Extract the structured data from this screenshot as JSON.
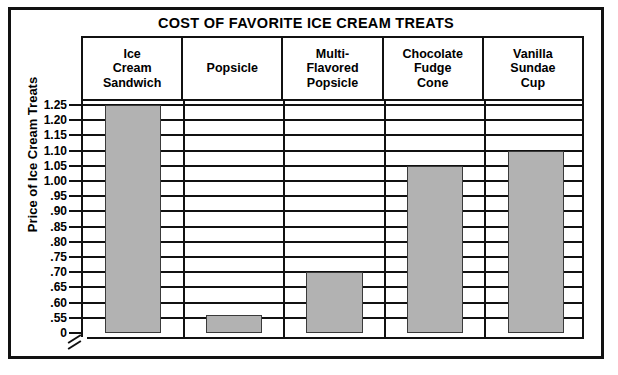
{
  "chart_data": {
    "type": "bar",
    "title": "COST OF FAVORITE ICE CREAM TREATS",
    "xlabel": "",
    "ylabel": "Price of Ice Cream Treats",
    "categories": [
      "Ice Cream Sandwich",
      "Popsicle",
      "Multi-Flavored Popsicle",
      "Chocolate Fudge Cone",
      "Vanilla Sundae Cup"
    ],
    "category_lines": [
      [
        "Ice",
        "Cream",
        "Sandwich"
      ],
      [
        "Popsicle"
      ],
      [
        "Multi-",
        "Flavored",
        "Popsicle"
      ],
      [
        "Chocolate",
        "Fudge",
        "Cone"
      ],
      [
        "Vanilla",
        "Sundae",
        "Cup"
      ]
    ],
    "values": [
      1.25,
      0.56,
      0.7,
      1.05,
      1.1
    ],
    "ylim": [
      0.5,
      1.275
    ],
    "axis_break": true,
    "axis_break_symbol": "//",
    "grid": true,
    "legend": "none",
    "bar_color": "#b2b2b2",
    "bar_edge_color": "#3a3a3a",
    "line_color": "#111111",
    "background_color": "#ffffff",
    "yticks": [
      {
        "value": 0,
        "label": "0"
      },
      {
        "value": 0.55,
        "label": ".55"
      },
      {
        "value": 0.6,
        "label": ".60"
      },
      {
        "value": 0.65,
        "label": ".65"
      },
      {
        "value": 0.7,
        "label": ".70"
      },
      {
        "value": 0.75,
        "label": ".75"
      },
      {
        "value": 0.8,
        "label": ".80"
      },
      {
        "value": 0.85,
        "label": ".85"
      },
      {
        "value": 0.9,
        "label": ".90"
      },
      {
        "value": 0.95,
        "label": ".95"
      },
      {
        "value": 1.0,
        "label": "1.00"
      },
      {
        "value": 1.05,
        "label": "1.05"
      },
      {
        "value": 1.1,
        "label": "1.10"
      },
      {
        "value": 1.15,
        "label": "1.15"
      },
      {
        "value": 1.2,
        "label": "1.20"
      },
      {
        "value": 1.25,
        "label": "1.25"
      }
    ]
  }
}
